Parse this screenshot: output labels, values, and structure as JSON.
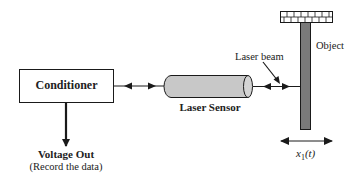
{
  "diagram": {
    "conditioner": {
      "label": "Conditioner"
    },
    "output": {
      "title": "Voltage Out",
      "subtitle": "(Record the data)"
    },
    "sensor": {
      "label": "Laser Sensor"
    },
    "beam": {
      "label": "Laser beam"
    },
    "object": {
      "label": "Object"
    },
    "displacement": {
      "label_main": "x",
      "label_sub": "1",
      "label_arg": "(t)"
    }
  },
  "colors": {
    "line": "#1a1a1a",
    "sensor_fill": "#c8c8c8",
    "object_fill": "#7a7a7a",
    "brick_fill": "#ffffff"
  }
}
